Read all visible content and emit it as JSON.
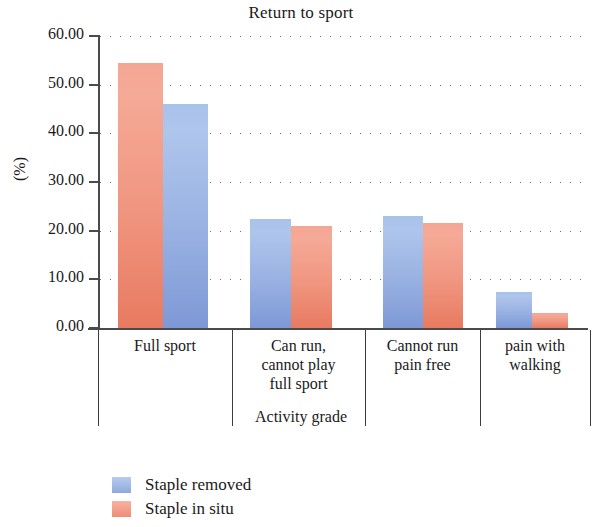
{
  "chart_data": {
    "type": "bar",
    "title": "Return to sport",
    "xlabel": "Activity grade",
    "ylabel": "(%)",
    "categories": [
      "Full sport",
      "Can run,\ncannot play\nfull sport",
      "Cannot run\npain free",
      "pain with\nwalking"
    ],
    "series": [
      {
        "name": "Staple removed",
        "color": "#9ab2e2",
        "values": [
          46.0,
          22.5,
          23.0,
          7.3
        ]
      },
      {
        "name": "Staple in situ",
        "color": "#f09680",
        "values": [
          54.5,
          21.0,
          21.5,
          3.0
        ]
      }
    ],
    "ylim": [
      0,
      60
    ],
    "yticks": [
      0,
      10,
      20,
      30,
      40,
      50,
      60
    ],
    "ytick_labels": [
      "0.00",
      "10.00",
      "20.00",
      "30.00",
      "40.00",
      "50.00",
      "60.00"
    ],
    "grid": "horizontal-dotted",
    "legend_position": "bottom-left",
    "note": "In the first category the salmon (Staple in situ) bar is drawn to the left of the blue bar; in the remaining categories the blue bar is drawn first."
  },
  "ticks": {
    "t0": "0.00",
    "t10": "10.00",
    "t20": "20.00",
    "t30": "30.00",
    "t40": "40.00",
    "t50": "50.00",
    "t60": "60.00"
  },
  "categories": {
    "c0_line0": "Full sport",
    "c1_line0": "Can run,",
    "c1_line1": "cannot play",
    "c1_line2": "full sport",
    "c2_line0": "Cannot run",
    "c2_line1": "pain free",
    "c3_line0": "pain with",
    "c3_line1": "walking"
  },
  "legend": {
    "item0": "Staple removed",
    "item1": "Staple in situ"
  }
}
